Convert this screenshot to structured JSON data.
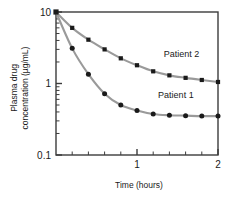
{
  "chart_data": {
    "type": "line",
    "title": "",
    "subtitle": "",
    "xlabel": "Time (hours)",
    "ylabel": "Plasma drug concentration (µg/mL)",
    "ylabel_line1": "Plasma drug",
    "ylabel_line2": "concentration (µg/mL)",
    "yscale": "log",
    "xscale": "linear",
    "xlim": [
      0,
      2
    ],
    "ylim": [
      0.1,
      10
    ],
    "grid": false,
    "legend_position": "inline-annotation",
    "x_tick_labels": [
      "1",
      "2"
    ],
    "x_tick_values": [
      1,
      2
    ],
    "x_minor_ticks": [
      0.2,
      0.4,
      0.6,
      0.8,
      1.2,
      1.4,
      1.6,
      1.8
    ],
    "y_tick_labels": [
      "10",
      "1",
      "0.1"
    ],
    "y_tick_values": [
      10,
      1,
      0.1
    ],
    "line_color": "#9a9a9a",
    "marker_color": "#1a1a1a",
    "frame_color": "#3c3c3c",
    "background": "#ffffff",
    "x": [
      0,
      0.2,
      0.4,
      0.6,
      0.8,
      1.0,
      1.2,
      1.4,
      1.6,
      1.8,
      2.0
    ],
    "series": [
      {
        "name": "Patient 2",
        "marker": "square",
        "values": [
          10.0,
          6.0,
          4.1,
          3.0,
          2.25,
          1.8,
          1.48,
          1.3,
          1.2,
          1.12,
          1.05
        ]
      },
      {
        "name": "Patient 1",
        "marker": "circle",
        "values": [
          10.0,
          3.1,
          1.35,
          0.72,
          0.5,
          0.42,
          0.375,
          0.36,
          0.355,
          0.35,
          0.35
        ]
      }
    ],
    "annotations": [
      {
        "text": "Patient 2",
        "x": 1.55,
        "y": 2.35
      },
      {
        "text": "Patient 1",
        "x": 1.48,
        "y": 0.62
      }
    ]
  }
}
